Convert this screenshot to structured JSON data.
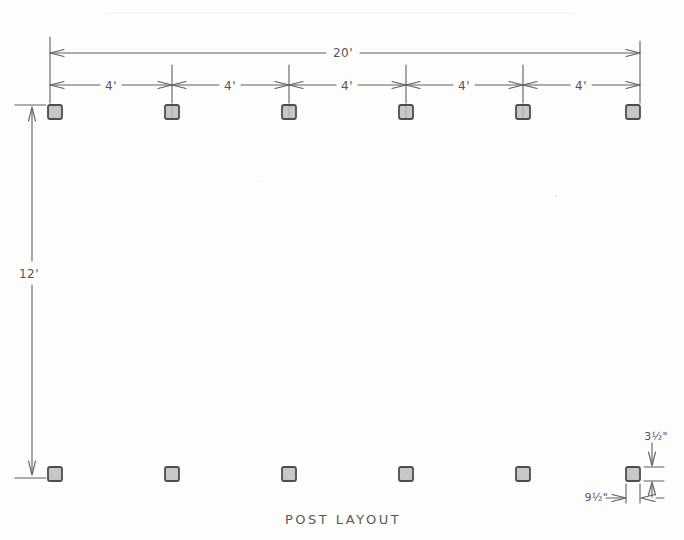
{
  "title": "POST LAYOUT",
  "dimensions": {
    "overall_width": "20'",
    "bay_widths": [
      "4'",
      "4'",
      "4'",
      "4'",
      "4'"
    ],
    "depth": "12'",
    "post_section": {
      "depth_label": "3½\"",
      "width_label": "9½\""
    }
  },
  "posts": {
    "rows": 2,
    "columns": 6,
    "shape": "square"
  }
}
